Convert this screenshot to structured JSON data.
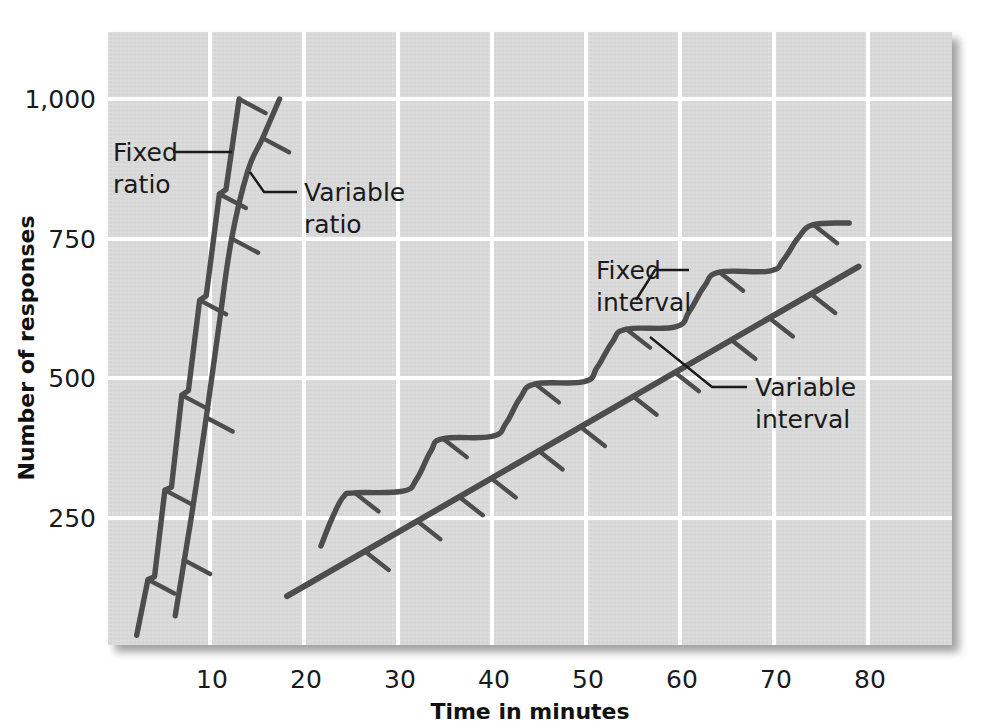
{
  "figure": {
    "background_color": "#ffffff",
    "plot_background_color": "#d9d9d9",
    "grid_color": "#ffffff",
    "line_color": "#4d4d4d",
    "text_color": "#1a1a1a"
  },
  "chart_data": {
    "type": "line",
    "title": "",
    "subtitle": "",
    "xlabel": "Time in minutes",
    "ylabel": "Number of responses",
    "xlim": [
      0,
      90
    ],
    "ylim": [
      0,
      1075
    ],
    "xticks": [
      10,
      20,
      30,
      40,
      50,
      60,
      70,
      80
    ],
    "xtick_labels": [
      "10",
      "20",
      "30",
      "40",
      "50",
      "60",
      "70",
      "80"
    ],
    "yticks": [
      250,
      500,
      750,
      1000
    ],
    "ytick_labels": [
      "250",
      "500",
      "750",
      "1,000"
    ],
    "grid": true,
    "legend_position": "inline-annotations",
    "series": [
      {
        "name": "Fixed ratio",
        "label": "Fixed ratio",
        "label_line1": "Fixed",
        "label_line2": "ratio",
        "style": "steep stair-step with hash marks",
        "points": [
          [
            2.2,
            40
          ],
          [
            3.4,
            140
          ],
          [
            4.1,
            145
          ],
          [
            5.2,
            300
          ],
          [
            5.9,
            305
          ],
          [
            7.0,
            470
          ],
          [
            7.7,
            478
          ],
          [
            8.9,
            640
          ],
          [
            9.6,
            648
          ],
          [
            11.0,
            830
          ],
          [
            11.7,
            838
          ],
          [
            13.1,
            1000
          ]
        ],
        "reinforcement_marks": [
          [
            3.4,
            140
          ],
          [
            5.2,
            300
          ],
          [
            7.0,
            470
          ],
          [
            8.9,
            640
          ],
          [
            11.0,
            830
          ],
          [
            13.1,
            1000
          ]
        ]
      },
      {
        "name": "Variable ratio",
        "label": "Variable ratio",
        "label_line1": "Variable",
        "label_line2": "ratio",
        "style": "steep smooth line with hash marks",
        "points": [
          [
            6.3,
            75
          ],
          [
            8.0,
            250
          ],
          [
            9.6,
            430
          ],
          [
            11.0,
            600
          ],
          [
            12.3,
            750
          ],
          [
            14.0,
            870
          ],
          [
            15.6,
            930
          ],
          [
            17.4,
            1000
          ]
        ],
        "reinforcement_marks": [
          [
            7.2,
            175
          ],
          [
            9.6,
            430
          ],
          [
            12.3,
            750
          ],
          [
            15.6,
            930
          ]
        ]
      },
      {
        "name": "Fixed interval",
        "label": "Fixed interval",
        "label_line1": "Fixed",
        "label_line2": "interval",
        "style": "scalloped step pattern with hash marks",
        "points": [
          [
            21.8,
            200
          ],
          [
            23.0,
            250
          ],
          [
            24.2,
            288
          ],
          [
            25.4,
            295
          ],
          [
            30.5,
            298
          ],
          [
            32.0,
            320
          ],
          [
            33.5,
            370
          ],
          [
            34.8,
            392
          ],
          [
            40.0,
            396
          ],
          [
            41.5,
            420
          ],
          [
            43.0,
            465
          ],
          [
            44.6,
            490
          ],
          [
            49.8,
            494
          ],
          [
            51.2,
            520
          ],
          [
            52.8,
            565
          ],
          [
            54.3,
            588
          ],
          [
            59.5,
            592
          ],
          [
            61.0,
            620
          ],
          [
            62.6,
            665
          ],
          [
            64.2,
            690
          ],
          [
            69.5,
            692
          ],
          [
            71.0,
            712
          ],
          [
            72.6,
            752
          ],
          [
            74.2,
            775
          ],
          [
            78.0,
            778
          ]
        ],
        "reinforcement_marks": [
          [
            25.4,
            295
          ],
          [
            34.8,
            392
          ],
          [
            44.6,
            490
          ],
          [
            54.3,
            588
          ],
          [
            64.2,
            690
          ],
          [
            74.2,
            775
          ]
        ]
      },
      {
        "name": "Variable interval",
        "label": "Variable interval",
        "label_line1": "Variable",
        "label_line2": "interval",
        "style": "steady straight line with hash marks",
        "points": [
          [
            18.2,
            110
          ],
          [
            79.0,
            700
          ]
        ],
        "reinforcement_marks": [
          [
            26.5,
            190
          ],
          [
            32.0,
            245
          ],
          [
            36.5,
            288
          ],
          [
            40.0,
            320
          ],
          [
            45.0,
            370
          ],
          [
            49.5,
            412
          ],
          [
            55.0,
            468
          ],
          [
            59.5,
            510
          ],
          [
            65.5,
            568
          ],
          [
            69.5,
            608
          ],
          [
            74.0,
            650
          ]
        ]
      }
    ],
    "annotations": [
      {
        "text": "Fixed ratio",
        "x": 3.0,
        "y": 905,
        "target_x": 12.3,
        "target_y": 900
      },
      {
        "text": "Variable ratio",
        "x": 17.0,
        "y": 820,
        "target_x": 15.0,
        "target_y": 820
      },
      {
        "text": "Fixed interval",
        "x": 56.0,
        "y": 660,
        "target_x": 62.5,
        "target_y": 600
      },
      {
        "text": "Variable interval",
        "x": 72.0,
        "y": 470,
        "target_x": 66.0,
        "target_y": 520
      }
    ]
  }
}
